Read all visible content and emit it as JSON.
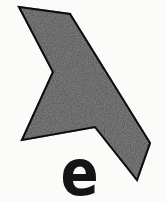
{
  "page": {
    "background": "#fbfbfa",
    "width": 166,
    "height": 202
  },
  "figure": {
    "shape_name": "gray-angular-polygon",
    "fill": "#9b9b9b",
    "stroke": "#1b1b1b",
    "stroke_width": 2,
    "points": [
      [
        19,
        7
      ],
      [
        70,
        14
      ],
      [
        150,
        143
      ],
      [
        137,
        180
      ],
      [
        95,
        127
      ],
      [
        22,
        140
      ],
      [
        53,
        72
      ]
    ],
    "label": "e",
    "label_color": "#141414"
  }
}
